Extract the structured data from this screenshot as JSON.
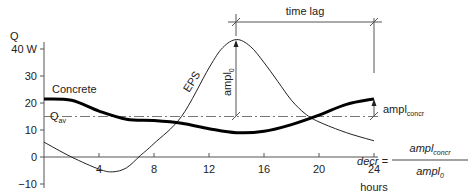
{
  "chart_data": {
    "type": "line",
    "title": "",
    "xlabel": "hours",
    "ylabel": "Q",
    "y_unit": "W",
    "xlim": [
      0,
      24
    ],
    "ylim": [
      -10,
      40
    ],
    "x_ticks": [
      4,
      8,
      12,
      16,
      20,
      24
    ],
    "y_ticks": [
      -10,
      0,
      10,
      20,
      30,
      40
    ],
    "y_tick_labels": [
      "−10",
      "0",
      "10",
      "20",
      "30",
      "40 W"
    ],
    "x_tick_labels": [
      "4",
      "8",
      "12",
      "16",
      "20",
      "24"
    ],
    "grid": false,
    "series": [
      {
        "name": "EPS",
        "style": "thin",
        "x": [
          0,
          2,
          4,
          5,
          6,
          7,
          8,
          10,
          12,
          13,
          14,
          15,
          16,
          17,
          18,
          19,
          20,
          22,
          24
        ],
        "values": [
          5.5,
          0,
          -4.5,
          -5.5,
          -4,
          0.5,
          5,
          15,
          33,
          40.5,
          43.5,
          41,
          35,
          28,
          21,
          16,
          13,
          9,
          6
        ]
      },
      {
        "name": "Concrete",
        "style": "thick",
        "x": [
          0,
          2,
          4,
          6,
          8,
          10,
          12,
          14,
          16,
          18,
          20,
          22,
          24
        ],
        "values": [
          21.5,
          21,
          17,
          14,
          13.5,
          12.5,
          10.5,
          9,
          9.5,
          12,
          15.5,
          19.5,
          21.5
        ]
      }
    ],
    "reference_lines": [
      {
        "name": "Q_av",
        "label_main": "Q",
        "label_sub": "av",
        "y": 15,
        "style": "dash-dot"
      }
    ],
    "annotations": {
      "time_lag": {
        "label": "time lag",
        "from_x": 14,
        "to_x": 24
      },
      "ampl_0": {
        "label_main": "ampl",
        "label_sub": "0",
        "x": 14,
        "from": 15,
        "to": 43.5
      },
      "ampl_concr": {
        "label_main": "ampl",
        "label_sub": "concr",
        "x": 24,
        "from": 15,
        "to": 21.5
      },
      "formula": {
        "lhs": "decr =",
        "num_main": "ampl",
        "num_sub": "concr",
        "den_main": "ampl",
        "den_sub": "0"
      }
    },
    "series_labels": {
      "eps": "EPS",
      "concrete": "Concrete"
    }
  }
}
